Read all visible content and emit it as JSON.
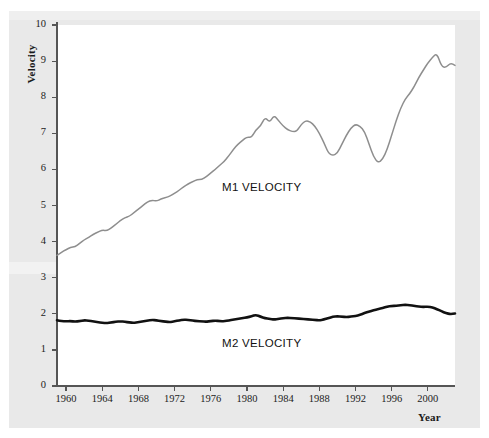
{
  "chart_data": {
    "type": "line",
    "title": "",
    "xlabel": "Year",
    "ylabel": "Velocity",
    "xlim": [
      1959,
      2003
    ],
    "ylim": [
      0,
      10
    ],
    "grid": false,
    "legend_position": "inline-annotation",
    "xticks": [
      "1960",
      "1964",
      "1968",
      "1972",
      "1976",
      "1980",
      "1984",
      "1988",
      "1992",
      "1996",
      "2000"
    ],
    "xtick_values": [
      1960,
      1964,
      1968,
      1972,
      1976,
      1980,
      1984,
      1988,
      1992,
      1996,
      2000
    ],
    "yticks": [
      "0",
      "1",
      "2",
      "3",
      "4",
      "5",
      "6",
      "7",
      "8",
      "9",
      "10"
    ],
    "ytick_values": [
      0,
      1,
      2,
      3,
      4,
      5,
      6,
      7,
      8,
      9,
      10
    ],
    "annotations": [
      {
        "text": "M1 VELOCITY",
        "x": 1976.5,
        "y": 6.1
      },
      {
        "text": "M2 VELOCITY",
        "x": 1976.5,
        "y": 1.45
      }
    ],
    "series": [
      {
        "name": "M1 VELOCITY",
        "color": "#8e8e8e",
        "width": 1.5,
        "x": [
          1959.0,
          1959.5,
          1960.0,
          1960.5,
          1961.0,
          1961.5,
          1962.0,
          1962.5,
          1963.0,
          1963.5,
          1964.0,
          1964.5,
          1965.0,
          1965.5,
          1966.0,
          1966.5,
          1967.0,
          1967.5,
          1968.0,
          1968.5,
          1969.0,
          1969.5,
          1970.0,
          1970.5,
          1971.0,
          1971.5,
          1972.0,
          1972.5,
          1973.0,
          1973.5,
          1974.0,
          1974.5,
          1975.0,
          1975.5,
          1976.0,
          1976.5,
          1977.0,
          1977.5,
          1978.0,
          1978.5,
          1979.0,
          1979.5,
          1980.0,
          1980.5,
          1981.0,
          1981.5,
          1982.0,
          1982.5,
          1983.0,
          1983.5,
          1984.0,
          1984.5,
          1985.0,
          1985.5,
          1986.0,
          1986.5,
          1987.0,
          1987.5,
          1988.0,
          1988.5,
          1989.0,
          1989.5,
          1990.0,
          1990.5,
          1991.0,
          1991.5,
          1992.0,
          1992.5,
          1993.0,
          1993.5,
          1994.0,
          1994.5,
          1995.0,
          1995.5,
          1996.0,
          1996.5,
          1997.0,
          1997.5,
          1998.0,
          1998.5,
          1999.0,
          1999.5,
          2000.0,
          2000.5,
          2001.0,
          2001.5,
          2002.0,
          2002.5,
          2003.0
        ],
        "y": [
          3.62,
          3.7,
          3.78,
          3.84,
          3.86,
          3.95,
          4.05,
          4.12,
          4.2,
          4.26,
          4.32,
          4.3,
          4.38,
          4.48,
          4.58,
          4.66,
          4.7,
          4.8,
          4.9,
          5.0,
          5.1,
          5.15,
          5.12,
          5.18,
          5.22,
          5.26,
          5.34,
          5.42,
          5.52,
          5.6,
          5.66,
          5.72,
          5.72,
          5.8,
          5.9,
          6.0,
          6.12,
          6.22,
          6.38,
          6.55,
          6.7,
          6.8,
          6.9,
          6.88,
          7.1,
          7.2,
          7.45,
          7.3,
          7.5,
          7.35,
          7.2,
          7.1,
          7.05,
          7.05,
          7.25,
          7.35,
          7.32,
          7.2,
          7.0,
          6.75,
          6.45,
          6.38,
          6.45,
          6.7,
          6.95,
          7.15,
          7.25,
          7.2,
          7.05,
          6.7,
          6.35,
          6.18,
          6.28,
          6.55,
          6.95,
          7.35,
          7.7,
          7.95,
          8.1,
          8.3,
          8.55,
          8.75,
          8.95,
          9.1,
          9.22,
          8.85,
          8.82,
          8.95,
          8.88
        ]
      },
      {
        "name": "M2 VELOCITY",
        "color": "#111111",
        "width": 2.6,
        "x": [
          1959.0,
          1959.5,
          1960.0,
          1960.5,
          1961.0,
          1961.5,
          1962.0,
          1962.5,
          1963.0,
          1963.5,
          1964.0,
          1964.5,
          1965.0,
          1965.5,
          1966.0,
          1966.5,
          1967.0,
          1967.5,
          1968.0,
          1968.5,
          1969.0,
          1969.5,
          1970.0,
          1970.5,
          1971.0,
          1971.5,
          1972.0,
          1972.5,
          1973.0,
          1973.5,
          1974.0,
          1974.5,
          1975.0,
          1975.5,
          1976.0,
          1976.5,
          1977.0,
          1977.5,
          1978.0,
          1978.5,
          1979.0,
          1979.5,
          1980.0,
          1980.5,
          1981.0,
          1981.5,
          1982.0,
          1982.5,
          1983.0,
          1983.5,
          1984.0,
          1984.5,
          1985.0,
          1985.5,
          1986.0,
          1986.5,
          1987.0,
          1987.5,
          1988.0,
          1988.5,
          1989.0,
          1989.5,
          1990.0,
          1990.5,
          1991.0,
          1991.5,
          1992.0,
          1992.5,
          1993.0,
          1993.5,
          1994.0,
          1994.5,
          1995.0,
          1995.5,
          1996.0,
          1996.5,
          1997.0,
          1997.5,
          1998.0,
          1998.5,
          1999.0,
          1999.5,
          2000.0,
          2000.5,
          2001.0,
          2001.5,
          2002.0,
          2002.5,
          2003.0
        ],
        "y": [
          1.82,
          1.8,
          1.79,
          1.8,
          1.78,
          1.8,
          1.82,
          1.81,
          1.79,
          1.77,
          1.75,
          1.74,
          1.76,
          1.78,
          1.79,
          1.78,
          1.76,
          1.75,
          1.77,
          1.79,
          1.81,
          1.83,
          1.82,
          1.8,
          1.78,
          1.77,
          1.79,
          1.82,
          1.84,
          1.83,
          1.81,
          1.8,
          1.79,
          1.78,
          1.8,
          1.81,
          1.8,
          1.79,
          1.82,
          1.84,
          1.86,
          1.88,
          1.9,
          1.93,
          1.97,
          1.92,
          1.88,
          1.86,
          1.84,
          1.86,
          1.88,
          1.89,
          1.88,
          1.87,
          1.86,
          1.85,
          1.84,
          1.83,
          1.82,
          1.84,
          1.88,
          1.92,
          1.93,
          1.92,
          1.91,
          1.92,
          1.94,
          1.97,
          2.02,
          2.06,
          2.1,
          2.13,
          2.16,
          2.2,
          2.22,
          2.22,
          2.24,
          2.25,
          2.24,
          2.22,
          2.2,
          2.19,
          2.2,
          2.18,
          2.13,
          2.07,
          2.02,
          1.99,
          2.01
        ]
      }
    ]
  },
  "labels": {
    "ylabel": "Velocity",
    "xlabel": "Year",
    "m1": "M1 VELOCITY",
    "m2": "M2 VELOCITY"
  },
  "colors": {
    "m1_line": "#8e8e8e",
    "m2_line": "#111111",
    "axis": "#555555",
    "page_background": "#e9e9e9",
    "plot_background": "#ffffff"
  }
}
